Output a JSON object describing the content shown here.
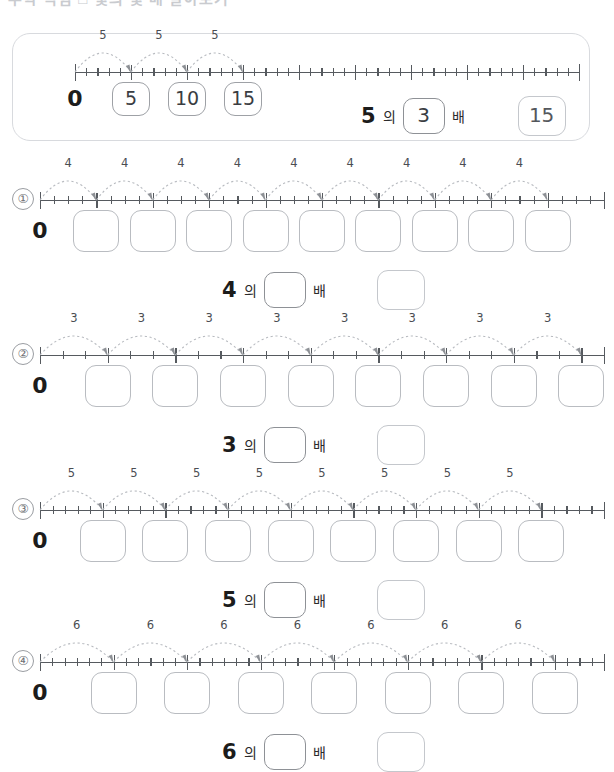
{
  "page": {
    "top_heading_faint": "수학 익힘  □ 몇의 몇 배 알아보기",
    "particle_of": "의",
    "particle_times": "배"
  },
  "example": {
    "name": "example",
    "step": 5,
    "hops": 3,
    "minor_per_hop": 5,
    "total_ticks": 45,
    "zero_label": "0",
    "hop_labels": [
      "5",
      "5",
      "5"
    ],
    "value_boxes": [
      "5",
      "10",
      "15"
    ],
    "equation": {
      "base": "5",
      "of": "의",
      "multiplier": "3",
      "times": "배",
      "result": "15"
    }
  },
  "problems": [
    {
      "index": "①",
      "step": 4,
      "hops": 9,
      "minor_per_hop": 4,
      "total_ticks": 40,
      "zero_label": "0",
      "hop_labels": [
        "4",
        "4",
        "4",
        "4",
        "4",
        "4",
        "4",
        "4",
        "4"
      ],
      "value_boxes": [
        "",
        "",
        "",
        "",
        "",
        "",
        "",
        "",
        ""
      ],
      "equation": {
        "base": "4",
        "of": "의",
        "multiplier": "",
        "times": "배",
        "result": ""
      }
    },
    {
      "index": "②",
      "step": 3,
      "hops": 8,
      "minor_per_hop": 3,
      "total_ticks": 25,
      "zero_label": "0",
      "hop_labels": [
        "3",
        "3",
        "3",
        "3",
        "3",
        "3",
        "3",
        "3"
      ],
      "value_boxes": [
        "",
        "",
        "",
        "",
        "",
        "",
        "",
        ""
      ],
      "equation": {
        "base": "3",
        "of": "의",
        "multiplier": "",
        "times": "배",
        "result": ""
      }
    },
    {
      "index": "③",
      "step": 5,
      "hops": 8,
      "minor_per_hop": 5,
      "total_ticks": 45,
      "zero_label": "0",
      "hop_labels": [
        "5",
        "5",
        "5",
        "5",
        "5",
        "5",
        "5",
        "5"
      ],
      "value_boxes": [
        "",
        "",
        "",
        "",
        "",
        "",
        "",
        ""
      ],
      "equation": {
        "base": "5",
        "of": "의",
        "multiplier": "",
        "times": "배",
        "result": ""
      }
    },
    {
      "index": "④",
      "step": 6,
      "hops": 7,
      "minor_per_hop": 6,
      "total_ticks": 46,
      "zero_label": "0",
      "hop_labels": [
        "6",
        "6",
        "6",
        "6",
        "6",
        "6",
        "6"
      ],
      "value_boxes": [
        "",
        "",
        "",
        "",
        "",
        "",
        ""
      ],
      "equation": {
        "base": "6",
        "of": "의",
        "multiplier": "",
        "times": "배",
        "result": ""
      }
    }
  ],
  "colors": {
    "axis": "#565a5f",
    "arc": "#b8bbc0",
    "box_border": "#b9bcc1",
    "slot_border": "#8e9196",
    "container_border": "#d8dade",
    "text": "#1c1c1c"
  }
}
